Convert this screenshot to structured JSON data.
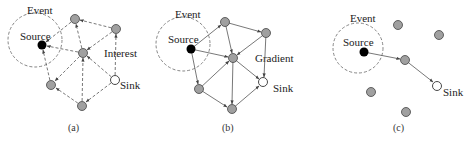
{
  "figure": {
    "panels": [
      {
        "id": "a",
        "caption": "(a)",
        "event_label": "Event",
        "source_label": "Source",
        "sink_label": "Sink",
        "annotation": "Interest",
        "edge_style": "dashed"
      },
      {
        "id": "b",
        "caption": "(b)",
        "event_label": "Event",
        "source_label": "Source",
        "sink_label": "Sink",
        "annotation": "Gradient",
        "edge_style": "solid"
      },
      {
        "id": "c",
        "caption": "(c)",
        "event_label": "Event",
        "source_label": "Source",
        "sink_label": "Sink",
        "annotation": "",
        "edge_style": "solid"
      }
    ],
    "colors": {
      "source_node": "#000000",
      "relay_node": "#a0a0a0",
      "sink_node": "#ffffff",
      "edge": "#555555",
      "event_circle": "#777777"
    }
  }
}
